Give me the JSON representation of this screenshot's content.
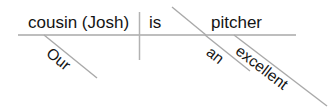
{
  "diagram": {
    "type": "reed-kellogg-sentence-diagram",
    "sentence": "Our cousin (Josh) is an excellent pitcher.",
    "colors": {
      "line": "#a9a9a9",
      "vertical_line": "#b2b2b2",
      "text": "#141414",
      "background": "#ffffff"
    },
    "baseline": {
      "subject": "cousin (Josh)",
      "verb": "is",
      "complement": "pitcher"
    },
    "modifiers": [
      {
        "word": "Our",
        "attaches_to": "cousin (Josh)"
      },
      {
        "word": "an",
        "attaches_to": "pitcher"
      },
      {
        "word": "excellent",
        "attaches_to": "pitcher"
      }
    ]
  }
}
